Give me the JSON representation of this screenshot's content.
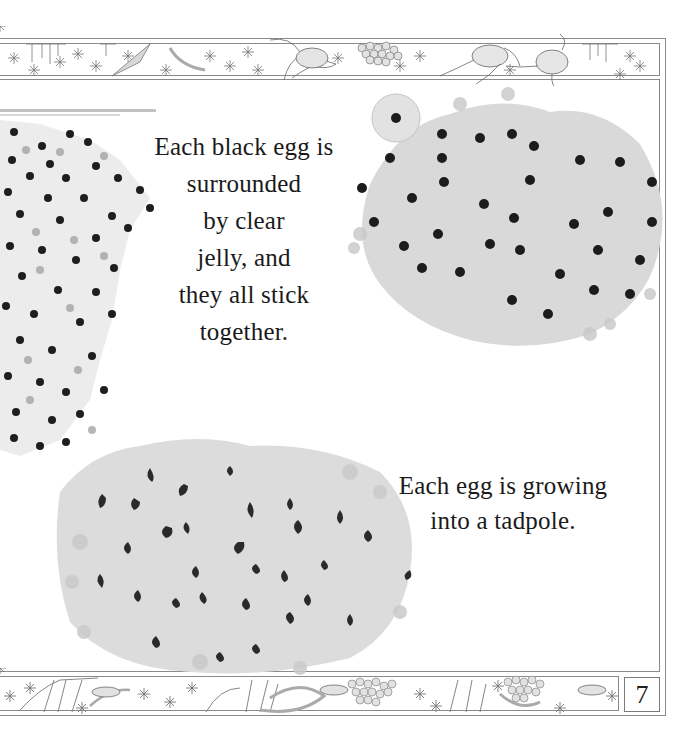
{
  "page": {
    "type": "picture-book page",
    "page_number": "7",
    "background": "#ffffff"
  },
  "captions": {
    "first": {
      "lines": [
        "Each black egg is",
        "surrounded",
        "by clear",
        "jelly, and",
        "they all stick",
        "together."
      ]
    },
    "second": {
      "lines": [
        "Each egg is growing",
        "into a tadpole."
      ]
    }
  },
  "illustrations": {
    "top_border": "frogs-pond-weed-frogspawn-border",
    "bottom_border": "fish-reeds-frogspawn-border",
    "left_spawn": "frogspawn-black-eggs",
    "right_spawn": "frogspawn-cluster-black-eggs",
    "bottom_spawn": "frogspawn-developing-tadpoles"
  },
  "colors": {
    "frame": "#8a8a8a",
    "text": "#1a1a1a",
    "jelly": "#d6d6d6",
    "egg": "#1c1c1c"
  }
}
